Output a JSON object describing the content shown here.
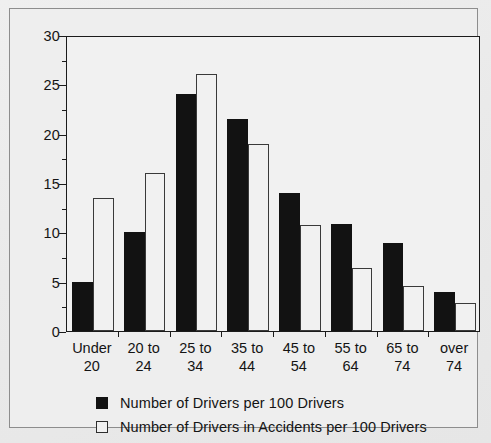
{
  "chart_data": {
    "type": "bar",
    "title": "",
    "xlabel": "",
    "ylabel": "",
    "ylim": [
      0,
      30
    ],
    "ytick_step": 5,
    "yminor_step": 2.5,
    "grid": false,
    "legend_position": "bottom-left",
    "categories": [
      "Under 20",
      "20 to 24",
      "25 to 34",
      "35 to 44",
      "45 to 54",
      "55 to 64",
      "65 to 74",
      "over 74"
    ],
    "category_lines": [
      [
        "Under",
        "20"
      ],
      [
        "20 to",
        "24"
      ],
      [
        "25 to",
        "34"
      ],
      [
        "35 to",
        "44"
      ],
      [
        "45 to",
        "54"
      ],
      [
        "55 to",
        "64"
      ],
      [
        "65 to",
        "74"
      ],
      [
        "over",
        "74"
      ]
    ],
    "yticks": [
      "0",
      "5",
      "10",
      "15",
      "20",
      "25",
      "30"
    ],
    "series": [
      {
        "name": "Number of Drivers per 100 Drivers",
        "style": "filled-black",
        "color": "#121212",
        "values": [
          5,
          10,
          24,
          21.5,
          14,
          10.8,
          8.9,
          4.0
        ]
      },
      {
        "name": "Number of Drivers in Accidents per 100 Drivers",
        "style": "open-white",
        "color": "#f1f1f1",
        "edge_color": "#3a3a3a",
        "values": [
          13.5,
          16,
          26,
          19,
          10.7,
          6.4,
          4.6,
          2.8
        ]
      }
    ]
  },
  "legend": {
    "items": [
      {
        "label": "Number of Drivers per 100 Drivers",
        "style": "dark"
      },
      {
        "label": "Number of Drivers in Accidents per 100 Drivers",
        "style": "light"
      }
    ]
  }
}
